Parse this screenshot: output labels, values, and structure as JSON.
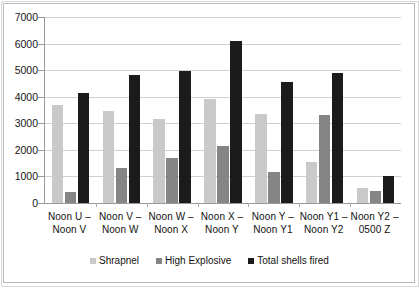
{
  "chart_data": {
    "type": "bar",
    "title": "",
    "xlabel": "",
    "ylabel": "",
    "ylim": [
      0,
      7000
    ],
    "ytick_step": 1000,
    "yticks": [
      "0",
      "1000",
      "2000",
      "3000",
      "4000",
      "5000",
      "6000",
      "7000"
    ],
    "grid": true,
    "legend_position": "bottom",
    "categories": [
      {
        "line1": "Noon U –",
        "line2": "Noon V"
      },
      {
        "line1": "Noon V –",
        "line2": "Noon W"
      },
      {
        "line1": "Noon W –",
        "line2": "Noon X"
      },
      {
        "line1": "Noon X –",
        "line2": "Noon Y"
      },
      {
        "line1": "Noon Y –",
        "line2": "Noon Y1"
      },
      {
        "line1": "Noon Y1 –",
        "line2": "Noon Y2"
      },
      {
        "line1": "Noon Y2 –",
        "line2": "0500 Z"
      }
    ],
    "series": [
      {
        "name": "Shrapnel",
        "color": "#c9c9c9",
        "values": [
          3700,
          3450,
          3150,
          3900,
          3350,
          1550,
          550
        ]
      },
      {
        "name": "High Explosive",
        "color": "#858585",
        "values": [
          400,
          1300,
          1700,
          2150,
          1150,
          3300,
          450
        ]
      },
      {
        "name": "Total shells fired",
        "color": "#1b1b1b",
        "values": [
          4150,
          4800,
          4950,
          6100,
          4550,
          4900,
          1000
        ]
      }
    ]
  }
}
